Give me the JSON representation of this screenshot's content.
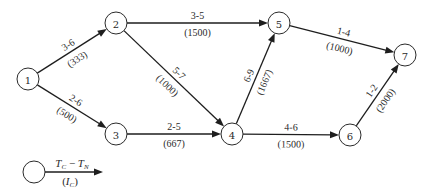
{
  "diagram": {
    "type": "network",
    "nodes": [
      {
        "id": "1",
        "label": "1"
      },
      {
        "id": "2",
        "label": "2"
      },
      {
        "id": "3",
        "label": "3"
      },
      {
        "id": "4",
        "label": "4"
      },
      {
        "id": "5",
        "label": "5"
      },
      {
        "id": "6",
        "label": "6"
      },
      {
        "id": "7",
        "label": "7"
      }
    ],
    "edges": [
      {
        "from": "1",
        "to": "2",
        "top": "3-6",
        "bottom": "(333)"
      },
      {
        "from": "1",
        "to": "3",
        "top": "2-6",
        "bottom": "(500)"
      },
      {
        "from": "2",
        "to": "5",
        "top": "3-5",
        "bottom": "(1500)"
      },
      {
        "from": "2",
        "to": "4",
        "top": "5-7",
        "bottom": "(1000)"
      },
      {
        "from": "3",
        "to": "4",
        "top": "2-5",
        "bottom": "(667)"
      },
      {
        "from": "4",
        "to": "5",
        "top": "6-9",
        "bottom": "(1667)"
      },
      {
        "from": "4",
        "to": "6",
        "top": "4-6",
        "bottom": "(1500)"
      },
      {
        "from": "5",
        "to": "7",
        "top": "1-4",
        "bottom": "(1000)"
      },
      {
        "from": "6",
        "to": "7",
        "top": "1-2",
        "bottom": "(2000)"
      }
    ]
  },
  "legend": {
    "top": "T_C − T_N",
    "top_main1": "T",
    "top_sub1": "C",
    "top_op": " − ",
    "top_main2": "T",
    "top_sub2": "N",
    "bottom_open": "(",
    "bottom_main": "I",
    "bottom_sub": "C",
    "bottom_close": ")"
  }
}
